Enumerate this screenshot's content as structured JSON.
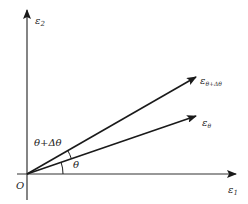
{
  "diagram": {
    "type": "strain vector rotation diagram",
    "colors": {
      "line": "#1a1a1a",
      "axis": "#333333",
      "text": "#222222",
      "background": "#ffffff"
    },
    "axes": {
      "x": {
        "symbol": "ε",
        "subscript": "1"
      },
      "y": {
        "symbol": "ε",
        "subscript": "2"
      },
      "origin_label": "O"
    },
    "vectors": [
      {
        "name": "upper",
        "symbol": "ε",
        "subscript": "θ+Δθ",
        "angle_label": "θ+Δθ"
      },
      {
        "name": "lower",
        "symbol": "ε",
        "subscript": "θ",
        "angle_label": "θ"
      }
    ]
  }
}
